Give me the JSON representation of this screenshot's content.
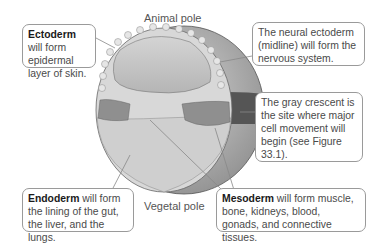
{
  "poles": {
    "animal": "Animal pole",
    "vegetal": "Vegetal pole"
  },
  "callouts": {
    "ectoderm": {
      "term": "Ectoderm",
      "rest": " will form epidermal layer of skin."
    },
    "neural": {
      "text": "The neural ectoderm (midline) will form the nervous system."
    },
    "gray_crescent": {
      "text": "The gray crescent is the site where major cell movement will begin (see Figure 33.1)."
    },
    "endoderm": {
      "term": "Endoderm",
      "rest": " will form the lining of the gut, the liver, and the lungs."
    },
    "mesoderm": {
      "term": "Mesoderm",
      "rest": " will form muscle, bone, kidneys, blood, gonads, and connective tissues."
    }
  },
  "colors": {
    "ectoderm_cells": "#d6d6d6",
    "blastocoel": "#c4c4c4",
    "mesoderm_cells": "#8f8f8f",
    "endoderm_cells": "#cfcfcf",
    "gray_crescent": "#555555",
    "outer_surface": "#9e9e9e"
  }
}
